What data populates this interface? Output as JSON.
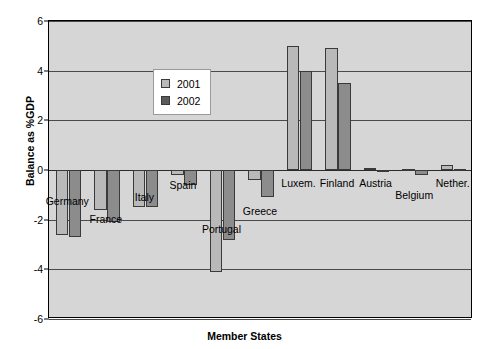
{
  "chart_data": {
    "type": "bar",
    "title": "",
    "xlabel": "Member States",
    "ylabel": "Balance as %GDP",
    "ylim": [
      -6,
      6
    ],
    "yticks": [
      6,
      4,
      2,
      0,
      -2,
      -4,
      -6
    ],
    "ytick_labels": [
      "6",
      "4",
      "2",
      "0",
      "-2",
      "-4",
      "-6"
    ],
    "grid": true,
    "legend_position": "inside-upper-left",
    "categories": [
      "Germany",
      "France",
      "Italy",
      "Spain",
      "Portugal",
      "Greece",
      "Luxem.",
      "Finland",
      "Austria",
      "Belgium",
      "Nether."
    ],
    "series": [
      {
        "name": "2001",
        "color": "#b9b9b9",
        "values": [
          -2.6,
          -1.6,
          -1.5,
          -0.2,
          -4.1,
          -0.4,
          5.0,
          4.9,
          0.1,
          0.05,
          0.2
        ]
      },
      {
        "name": "2002",
        "color": "#8c8c8c",
        "values": [
          -2.7,
          -2.1,
          -1.5,
          -0.6,
          -2.8,
          -1.1,
          4.0,
          3.5,
          0.0,
          -0.2,
          0.05
        ]
      }
    ],
    "label_offsets": [
      22,
      40,
      18,
      6,
      50,
      32,
      4,
      4,
      4,
      16,
      4
    ]
  }
}
